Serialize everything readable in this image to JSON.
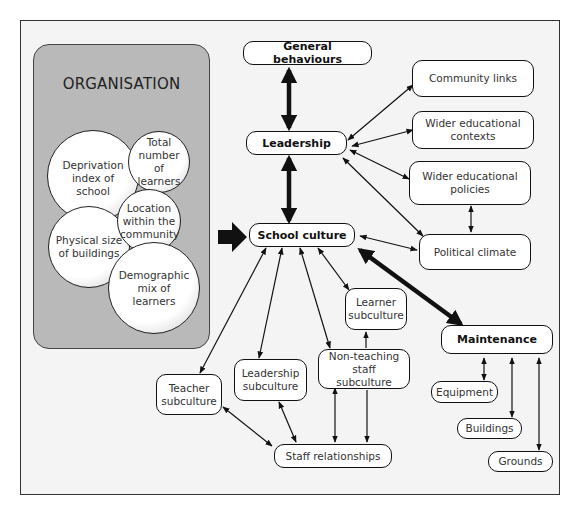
{
  "diagram": {
    "organisation": {
      "title": "ORGANISATION",
      "factors": [
        {
          "label": "Deprivation index of school"
        },
        {
          "label": "Total number of learners"
        },
        {
          "label": "Location within the community"
        },
        {
          "label": "Physical size of buildings"
        },
        {
          "label": "Demographic mix of learners"
        }
      ]
    },
    "nodes": {
      "general_behaviours": "General behaviours",
      "leadership": "Leadership",
      "school_culture": "School culture",
      "maintenance": "Maintenance",
      "community_links": "Community links",
      "wider_educational_contexts": "Wider educational contexts",
      "wider_educational_policies": "Wider educational policies",
      "political_climate": "Political climate",
      "learner_subculture": "Learner subculture",
      "non_teaching_staff_subculture": "Non-teaching staff subculture",
      "leadership_subculture": "Leadership subculture",
      "teacher_subculture": "Teacher subculture",
      "staff_relationships": "Staff relationships",
      "equipment": "Equipment",
      "buildings": "Buildings",
      "grounds": "Grounds"
    },
    "edges": [
      {
        "from": "organisation",
        "to": "school_culture",
        "style": "thick-block"
      },
      {
        "from": "general_behaviours",
        "to": "leadership",
        "style": "thick-double"
      },
      {
        "from": "leadership",
        "to": "school_culture",
        "style": "thick-double"
      },
      {
        "from": "school_culture",
        "to": "maintenance",
        "style": "thick-double"
      },
      {
        "from": "leadership",
        "to": "community_links",
        "style": "double"
      },
      {
        "from": "leadership",
        "to": "wider_educational_contexts",
        "style": "double"
      },
      {
        "from": "leadership",
        "to": "wider_educational_policies",
        "style": "double"
      },
      {
        "from": "leadership",
        "to": "political_climate",
        "style": "double"
      },
      {
        "from": "wider_educational_policies",
        "to": "political_climate",
        "style": "double"
      },
      {
        "from": "school_culture",
        "to": "political_climate",
        "style": "double"
      },
      {
        "from": "school_culture",
        "to": "teacher_subculture",
        "style": "double"
      },
      {
        "from": "school_culture",
        "to": "leadership_subculture",
        "style": "double"
      },
      {
        "from": "school_culture",
        "to": "non_teaching_staff_subculture",
        "style": "double"
      },
      {
        "from": "school_culture",
        "to": "learner_subculture",
        "style": "double"
      },
      {
        "from": "non_teaching_staff_subculture",
        "to": "learner_subculture",
        "style": "single"
      },
      {
        "from": "teacher_subculture",
        "to": "staff_relationships",
        "style": "double"
      },
      {
        "from": "leadership_subculture",
        "to": "staff_relationships",
        "style": "double"
      },
      {
        "from": "non_teaching_staff_subculture",
        "to": "staff_relationships",
        "style": "double"
      },
      {
        "from": "non_teaching_staff_subculture",
        "to": "staff_relationships",
        "style": "single"
      },
      {
        "from": "maintenance",
        "to": "equipment",
        "style": "double"
      },
      {
        "from": "maintenance",
        "to": "buildings",
        "style": "double"
      },
      {
        "from": "maintenance",
        "to": "grounds",
        "style": "double"
      }
    ]
  }
}
